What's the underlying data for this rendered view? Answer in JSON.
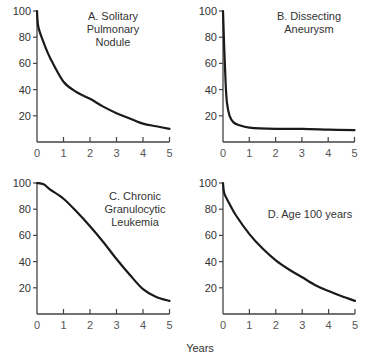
{
  "figure": {
    "xlabel": "Years"
  },
  "panels": [
    {
      "id": "A",
      "title_lines": [
        "A. Solitary",
        "Pulmonary",
        "Nodule"
      ]
    },
    {
      "id": "B",
      "title_lines": [
        "B. Dissecting",
        "Aneurysm"
      ]
    },
    {
      "id": "C",
      "title_lines": [
        "C. Chronic",
        "Granulocytic",
        "Leukemia"
      ]
    },
    {
      "id": "D",
      "title_lines": [
        "D. Age 100 years"
      ]
    }
  ],
  "chart_data": [
    {
      "type": "line",
      "title": "A. Solitary Pulmonary Nodule",
      "xlabel": "Years",
      "ylabel": "",
      "xlim": [
        0,
        5
      ],
      "ylim": [
        0,
        100
      ],
      "xticks": [
        0,
        1,
        2,
        3,
        4,
        5
      ],
      "yticks": [
        20,
        40,
        60,
        80,
        100
      ],
      "grid": false,
      "x": [
        0,
        0.05,
        0.25,
        0.5,
        1,
        1.5,
        2,
        2.5,
        3,
        3.5,
        4,
        4.5,
        5
      ],
      "values": [
        100,
        88,
        76,
        64,
        46,
        38,
        33,
        27,
        22,
        18,
        14,
        12,
        10
      ]
    },
    {
      "type": "line",
      "title": "B. Dissecting Aneurysm",
      "xlabel": "Years",
      "ylabel": "",
      "xlim": [
        0,
        5
      ],
      "ylim": [
        0,
        100
      ],
      "xticks": [
        0,
        1,
        2,
        3,
        4,
        5
      ],
      "yticks": [
        20,
        40,
        60,
        80,
        100
      ],
      "grid": false,
      "x": [
        0,
        0.05,
        0.1,
        0.15,
        0.25,
        0.4,
        0.6,
        1,
        2,
        3,
        4,
        5
      ],
      "values": [
        100,
        70,
        45,
        30,
        20,
        15,
        13,
        11,
        10,
        10,
        9.5,
        9
      ]
    },
    {
      "type": "line",
      "title": "C. Chronic Granulocytic Leukemia",
      "xlabel": "Years",
      "ylabel": "",
      "xlim": [
        0,
        5
      ],
      "ylim": [
        0,
        100
      ],
      "xticks": [
        0,
        1,
        2,
        3,
        4,
        5
      ],
      "yticks": [
        20,
        40,
        60,
        80,
        100
      ],
      "grid": false,
      "x": [
        0,
        0.25,
        0.5,
        1,
        1.5,
        2,
        2.5,
        3,
        3.5,
        4,
        4.5,
        5
      ],
      "values": [
        100,
        99,
        95,
        88,
        78,
        67,
        55,
        42,
        30,
        19,
        13,
        10
      ]
    },
    {
      "type": "line",
      "title": "D. Age 100 years",
      "xlabel": "Years",
      "ylabel": "",
      "xlim": [
        0,
        5
      ],
      "ylim": [
        0,
        100
      ],
      "xticks": [
        0,
        1,
        2,
        3,
        4,
        5
      ],
      "yticks": [
        20,
        40,
        60,
        80,
        100
      ],
      "grid": false,
      "x": [
        0,
        0.05,
        0.25,
        0.5,
        1,
        1.5,
        2,
        2.5,
        3,
        3.5,
        4,
        4.5,
        5
      ],
      "values": [
        100,
        92,
        84,
        75,
        61,
        50,
        41,
        34,
        28,
        22,
        17.5,
        13.5,
        10
      ]
    }
  ]
}
